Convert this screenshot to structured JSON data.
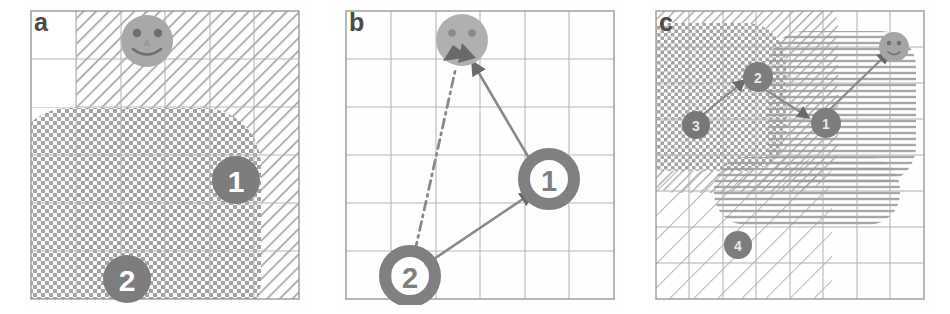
{
  "figure": {
    "type": "multi-panel-diagram",
    "panel_count": 3,
    "background_color": "#ffffff"
  },
  "colors": {
    "grid_line": "#b9b9b9",
    "panel_border": "#9a9a9a",
    "hatch_stroke": "#9d9d9d",
    "node_fill": "#7d7d7d",
    "node_text": "#ffffff",
    "smiley_fill": "#a8a8a8",
    "smiley_feature": "#6e6e6e",
    "arrow": "#8a8a8a",
    "arrowhead": "#6a6a6a",
    "label_color": "#4a4a4a"
  },
  "panels": [
    {
      "id": "a",
      "label": "a",
      "grid": {
        "cols": 6,
        "rows": 6,
        "show": true
      },
      "regions": [
        {
          "name": "diagonal-hatch-region",
          "pattern": "diagonal-hatch",
          "x": 1,
          "y": 0,
          "w": 5,
          "h": 6,
          "rounded": true
        },
        {
          "name": "crosshatch-region",
          "pattern": "crosshatch",
          "x": 0,
          "y": 2,
          "w": 5,
          "h": 4,
          "rounded": true
        }
      ],
      "nodes": [
        {
          "name": "smiley",
          "label": "",
          "kind": "smiley",
          "col": 2,
          "row": 0
        },
        {
          "name": "node-1",
          "label": "1",
          "kind": "numbered",
          "col": 4,
          "row": 3
        },
        {
          "name": "node-2",
          "label": "2",
          "kind": "numbered",
          "col": 1,
          "row": 5
        }
      ],
      "arrows": []
    },
    {
      "id": "b",
      "label": "b",
      "grid": {
        "cols": 6,
        "rows": 6,
        "show": true
      },
      "regions": [],
      "nodes": [
        {
          "name": "smiley",
          "label": "",
          "kind": "smiley",
          "col": 2,
          "row": 0
        },
        {
          "name": "node-1",
          "label": "1",
          "kind": "numbered-ring",
          "col": 4,
          "row": 3
        },
        {
          "name": "node-2",
          "label": "2",
          "kind": "numbered-ring",
          "col": 1,
          "row": 5
        }
      ],
      "arrows": [
        {
          "name": "arrow-node2-to-node1",
          "from": "node-2",
          "to": "node-1",
          "style": "solid"
        },
        {
          "name": "arrow-node1-to-smiley",
          "from": "node-1",
          "to": "smiley",
          "style": "solid"
        },
        {
          "name": "arrow-node2-to-smiley-direct",
          "from": "node-2",
          "to": "smiley",
          "style": "dash-dot"
        }
      ]
    },
    {
      "id": "c",
      "label": "c",
      "grid": {
        "cols": 8,
        "rows": 8,
        "show": true
      },
      "regions": [
        {
          "name": "diagonal-hatch-region-upper",
          "pattern": "diagonal-hatch",
          "x": 0,
          "y": 0,
          "w": 5,
          "h": 5,
          "rounded": true
        },
        {
          "name": "crosshatch-region-upper-left",
          "pattern": "crosshatch",
          "x": 0,
          "y": 1,
          "w": 4,
          "h": 4,
          "rounded": true
        },
        {
          "name": "horizontal-hatch-region-right",
          "pattern": "horizontal-hatch",
          "x": 4,
          "y": 1,
          "w": 3,
          "h": 4,
          "rounded": true
        },
        {
          "name": "horizontal-hatch-region-lower",
          "pattern": "horizontal-hatch",
          "x": 2,
          "y": 4,
          "w": 5,
          "h": 2,
          "rounded": true
        },
        {
          "name": "diagonal-hatch-region-lower",
          "pattern": "diagonal-hatch-wide",
          "x": 0,
          "y": 4,
          "w": 5,
          "h": 4,
          "rounded": true
        }
      ],
      "nodes": [
        {
          "name": "smiley",
          "label": "",
          "kind": "smiley-small",
          "col": 7,
          "row": 1
        },
        {
          "name": "node-1",
          "label": "1",
          "kind": "numbered-small",
          "col": 5,
          "row": 3
        },
        {
          "name": "node-2",
          "label": "2",
          "kind": "numbered-small",
          "col": 3,
          "row": 2
        },
        {
          "name": "node-3",
          "label": "3",
          "kind": "numbered-small",
          "col": 1,
          "row": 3
        },
        {
          "name": "node-4",
          "label": "4",
          "kind": "numbered-small",
          "col": 2,
          "row": 6
        }
      ],
      "arrows": [
        {
          "name": "arrow-node3-to-node2",
          "from": "node-3",
          "to": "node-2",
          "style": "solid"
        },
        {
          "name": "arrow-node2-to-node1",
          "from": "node-2",
          "to": "node-1",
          "style": "solid"
        },
        {
          "name": "arrow-node1-to-smiley",
          "from": "node-1",
          "to": "smiley",
          "style": "solid"
        }
      ]
    }
  ]
}
